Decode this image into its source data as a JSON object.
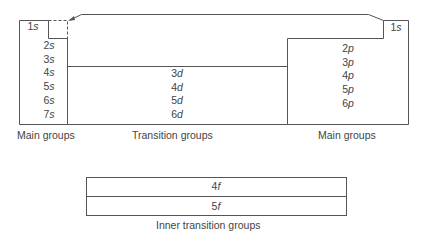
{
  "diagram": {
    "s_block": {
      "top_orbital": "1s",
      "orbitals": [
        "2s",
        "3s",
        "4s",
        "5s",
        "6s",
        "7s"
      ],
      "caption": "Main groups"
    },
    "d_block": {
      "orbitals": [
        "3d",
        "4d",
        "5d",
        "6d"
      ],
      "caption": "Transition groups"
    },
    "p_block": {
      "top_orbital": "1s",
      "orbitals": [
        "2p",
        "3p",
        "4p",
        "5p",
        "6p"
      ],
      "caption": "Main groups"
    },
    "f_block": {
      "orbitals": [
        "4f",
        "5f"
      ],
      "caption": "Inner transition groups"
    },
    "colors": {
      "line": "#555555",
      "text": "#444444"
    }
  }
}
